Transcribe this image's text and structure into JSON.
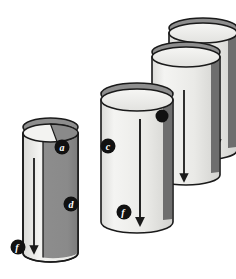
{
  "figure": {
    "background_color": "#ffffff",
    "outline_color": "#1a1a1a",
    "colors": {
      "body_light": "#e9e9e6",
      "body_highlight": "#f2f2f0",
      "body_shadow": "#8b8b8b",
      "top_face_light": "#f0f0ee",
      "top_face_dark": "#8b8b8b",
      "marker_fill": "#111111",
      "marker_text": "#ffffff",
      "arrow_color": "#1a1a1a"
    },
    "cylinders": [
      {
        "id": "cylinder-1",
        "name": "front-left-cylinder",
        "shaded": true,
        "arrow_direction": "down",
        "labels": [
          "a",
          "d",
          "f"
        ]
      },
      {
        "id": "cylinder-2",
        "name": "second-cylinder",
        "shaded": false,
        "arrow_direction": "down",
        "labels": [
          "c",
          "f"
        ]
      },
      {
        "id": "cylinder-3",
        "name": "third-cylinder",
        "shaded": false,
        "arrow_direction": "down",
        "labels": [
          ""
        ]
      },
      {
        "id": "cylinder-4",
        "name": "back-right-cylinder",
        "shaded": false,
        "arrow_direction": "down",
        "labels": []
      }
    ],
    "markers": [
      {
        "id": "marker-a",
        "letter": "a",
        "cx": 62,
        "cy": 147,
        "r": 7.5,
        "cylinder": "cylinder-1"
      },
      {
        "id": "marker-d",
        "letter": "d",
        "cx": 71,
        "cy": 204,
        "r": 7.5,
        "cylinder": "cylinder-1"
      },
      {
        "id": "marker-f1",
        "letter": "f",
        "cx": 18,
        "cy": 247,
        "r": 7.5,
        "cylinder": "cylinder-1"
      },
      {
        "id": "marker-c",
        "letter": "c",
        "cx": 108,
        "cy": 146,
        "r": 7.5,
        "cylinder": "cylinder-2"
      },
      {
        "id": "marker-f2",
        "letter": "f",
        "cx": 124,
        "cy": 212,
        "r": 7.5,
        "cylinder": "cylinder-2"
      },
      {
        "id": "marker-dot",
        "letter": "",
        "cx": 162,
        "cy": 116,
        "r": 6.5,
        "cylinder": "cylinder-3"
      }
    ]
  }
}
